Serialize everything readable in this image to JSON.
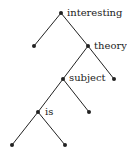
{
  "diagram": {
    "type": "binary-tree",
    "nodes": [
      {
        "id": "n0",
        "label": "interesting",
        "x": 61,
        "y": 13
      },
      {
        "id": "n1",
        "label": "",
        "x": 34,
        "y": 46
      },
      {
        "id": "n2",
        "label": "theory",
        "x": 88,
        "y": 46
      },
      {
        "id": "n3",
        "label": "subject",
        "x": 63,
        "y": 79
      },
      {
        "id": "n4",
        "label": "",
        "x": 114,
        "y": 79
      },
      {
        "id": "n5",
        "label": "is",
        "x": 38,
        "y": 112
      },
      {
        "id": "n6",
        "label": "",
        "x": 89,
        "y": 112
      },
      {
        "id": "n7",
        "label": "",
        "x": 12,
        "y": 145
      },
      {
        "id": "n8",
        "label": "",
        "x": 65,
        "y": 145
      }
    ],
    "edges": [
      [
        "n0",
        "n1"
      ],
      [
        "n0",
        "n2"
      ],
      [
        "n2",
        "n3"
      ],
      [
        "n2",
        "n4"
      ],
      [
        "n3",
        "n5"
      ],
      [
        "n3",
        "n6"
      ],
      [
        "n5",
        "n7"
      ],
      [
        "n5",
        "n8"
      ]
    ],
    "labels": {
      "interesting": "interesting",
      "theory": "theory",
      "subject": "subject",
      "is": "is"
    },
    "colors": {
      "line": "#222222",
      "node": "#222222"
    }
  }
}
